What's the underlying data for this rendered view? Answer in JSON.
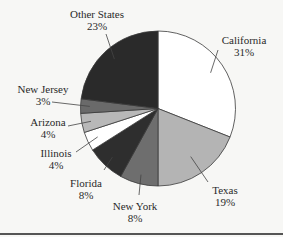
{
  "chart_data": {
    "type": "pie",
    "title": "",
    "start_angle_deg": 0,
    "direction": "clockwise",
    "slices": [
      {
        "label": "California",
        "value": 31,
        "pct_label": "31%",
        "color": "#ffffff"
      },
      {
        "label": "Texas",
        "value": 19,
        "pct_label": "19%",
        "color": "#b4b4b4"
      },
      {
        "label": "New York",
        "value": 8,
        "pct_label": "8%",
        "color": "#6e6e6e"
      },
      {
        "label": "Florida",
        "value": 8,
        "pct_label": "8%",
        "color": "#2e2e2e"
      },
      {
        "label": "Illinois",
        "value": 4,
        "pct_label": "4%",
        "color": "#ffffff"
      },
      {
        "label": "Arizona",
        "value": 4,
        "pct_label": "4%",
        "color": "#b8b8b8"
      },
      {
        "label": "New Jersey",
        "value": 3,
        "pct_label": "3%",
        "color": "#6a6a6a"
      },
      {
        "label": "Other States",
        "value": 23,
        "pct_label": "23%",
        "color": "#2a2a2a"
      }
    ],
    "legend": "none (labels with leader lines)"
  }
}
